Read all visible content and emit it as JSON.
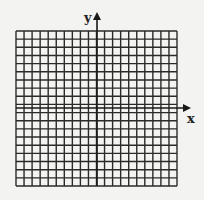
{
  "diagram": {
    "type": "coordinate-grid",
    "grid": {
      "columns": 20,
      "rows": 19,
      "left": 16,
      "top": 31,
      "right": 177,
      "bottom": 186,
      "line_color": "#2a2a2a",
      "cell_fill": "#f3f3f1"
    },
    "axes": {
      "x_label": "x",
      "y_label": "y",
      "origin_x": 97,
      "origin_y": 108,
      "x_arrow_end": 191,
      "y_arrow_end": 12,
      "color": "#1a1a1a"
    }
  }
}
